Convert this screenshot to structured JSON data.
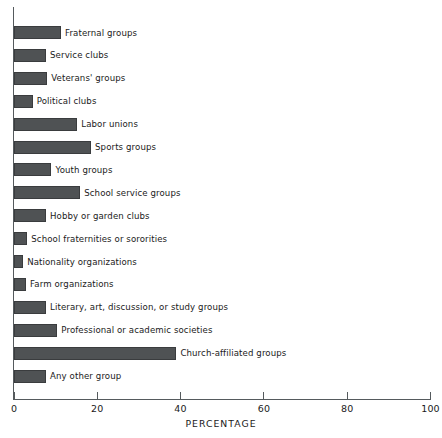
{
  "chart_data": {
    "type": "bar",
    "orientation": "horizontal",
    "title": "",
    "xlabel": "PERCENTAGE",
    "ylabel": "",
    "xlim": [
      0,
      100
    ],
    "xticks": [
      0,
      20,
      40,
      60,
      80,
      100
    ],
    "xtick_labels": [
      "0",
      "20",
      "40",
      "60",
      "80",
      "100"
    ],
    "grid": false,
    "legend": null,
    "bar_color": "#4f5254",
    "axis_color": "#555a5d",
    "categories": [
      "Fraternal groups",
      "Service clubs",
      "Veterans' groups",
      "Political clubs",
      "Labor unions",
      "Sports groups",
      "Youth groups",
      "School service groups",
      "Hobby or garden clubs",
      "School fraternities or sororities",
      "Nationality organizations",
      "Farm organizations",
      "Literary, art, discussion, or study groups",
      "Professional or academic societies",
      "Church-affiliated groups",
      "Any other group"
    ],
    "values": [
      11.3,
      7.7,
      8.0,
      4.5,
      15.2,
      18.5,
      9.0,
      15.9,
      7.7,
      3.2,
      2.2,
      2.9,
      7.7,
      10.4,
      39.0,
      7.7
    ]
  },
  "axis": {
    "x_title": "PERCENTAGE"
  }
}
